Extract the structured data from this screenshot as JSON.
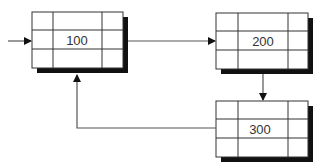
{
  "diagram": {
    "type": "linked-list-cycle",
    "nodes": [
      {
        "id": "node-1",
        "label": "100"
      },
      {
        "id": "node-2",
        "label": "200"
      },
      {
        "id": "node-3",
        "label": "300"
      }
    ],
    "edges": [
      {
        "from": "entry",
        "to": "node-1"
      },
      {
        "from": "node-1",
        "to": "node-2"
      },
      {
        "from": "node-2",
        "to": "node-3"
      },
      {
        "from": "node-3",
        "to": "node-1"
      }
    ],
    "colors": {
      "line": "#555555",
      "border": "#333333",
      "shadow": "#111111",
      "fill": "#ffffff"
    }
  }
}
